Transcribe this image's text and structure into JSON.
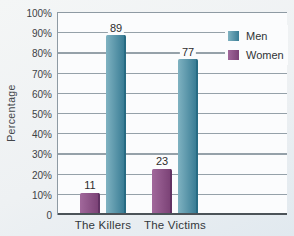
{
  "figure": {
    "background": "#eef1f3",
    "plot_background": "#fbfcfd"
  },
  "chart_data": {
    "type": "bar",
    "categories": [
      "The Killers",
      "The Victims"
    ],
    "series": [
      {
        "name": "Men",
        "values": [
          89,
          77
        ],
        "color": "#4f93a8",
        "gradient_left": "#7fb2c1",
        "gradient_right": "#3a7d95",
        "edge_color": "#276b83"
      },
      {
        "name": "Women",
        "values": [
          11,
          23
        ],
        "color": "#8d4f88",
        "gradient_left": "#a1689b",
        "gradient_right": "#7c4377",
        "edge_color": "#613263"
      }
    ],
    "group_bar_order": [
      "Women",
      "Men"
    ],
    "bar_value_labels": {
      "Men": [
        "89",
        "77"
      ],
      "Women": [
        "11",
        "23"
      ]
    },
    "title": "",
    "xlabel": "",
    "ylabel": "Percentage",
    "ylim": [
      0,
      100
    ],
    "ytick_step": 10,
    "ytick_labels": [
      "100%",
      "90%",
      "80%",
      "70%",
      "60%",
      "50%",
      "40%",
      "30%",
      "20%",
      "10%",
      "0"
    ],
    "grid": true,
    "gridline_color": "#95a1a9",
    "axis_line_color": "#4b5358",
    "plot_border_color": "#8e9aa3",
    "legend": {
      "position": "upper-right",
      "entries": [
        "Men",
        "Women"
      ]
    }
  }
}
